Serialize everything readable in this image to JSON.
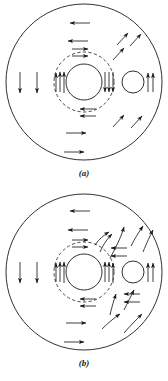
{
  "figure": {
    "type": "vector-diagram",
    "background_color": "#ffffff",
    "stroke_color": "#1a1a1a",
    "panels": [
      {
        "id": "a",
        "caption": "(a)",
        "geometry": {
          "outer_circle": {
            "cx": 84,
            "cy": 82,
            "r": 78,
            "style": "solid"
          },
          "dashed_circle": {
            "cx": 84,
            "cy": 82,
            "r": 30,
            "style": "dashed"
          },
          "inner_circle": {
            "cx": 84,
            "cy": 82,
            "r": 18,
            "style": "solid"
          },
          "small_circle": {
            "cx": 133,
            "cy": 82,
            "r": 11,
            "style": "solid"
          }
        },
        "arrow_style": "straight",
        "vector_groups": [
          {
            "name": "left-field-down",
            "direction": "down",
            "count": 2
          },
          {
            "name": "top-field-left",
            "direction": "left",
            "count": 2
          },
          {
            "name": "bottom-field-right",
            "direction": "right",
            "count": 2
          },
          {
            "name": "inner-left-up",
            "direction": "up",
            "count": 3
          },
          {
            "name": "inner-right-down",
            "direction": "down",
            "count": 3
          },
          {
            "name": "inner-top-right",
            "direction": "right",
            "count": 2
          },
          {
            "name": "inner-bottom-left",
            "direction": "left",
            "count": 2
          },
          {
            "name": "small-circle-right-up",
            "direction": "up",
            "count": 2
          },
          {
            "name": "upper-right-diagonal",
            "direction": "up-right",
            "count": 3
          },
          {
            "name": "lower-right-diagonal",
            "direction": "up-right",
            "count": 2
          }
        ]
      },
      {
        "id": "b",
        "caption": "(b)",
        "geometry": {
          "outer_circle": {
            "cx": 84,
            "cy": 82,
            "r": 78,
            "style": "solid"
          },
          "dashed_circle": {
            "cx": 84,
            "cy": 82,
            "r": 30,
            "style": "dashed"
          },
          "inner_circle": {
            "cx": 84,
            "cy": 82,
            "r": 18,
            "style": "solid"
          },
          "small_circle": {
            "cx": 133,
            "cy": 82,
            "r": 11,
            "style": "solid"
          }
        },
        "arrow_style": "curved",
        "vector_groups": [
          {
            "name": "left-field-down",
            "direction": "down",
            "count": 2
          },
          {
            "name": "top-field-left",
            "direction": "left",
            "count": 2
          },
          {
            "name": "bottom-field-right",
            "direction": "right",
            "count": 2
          },
          {
            "name": "inner-left-up",
            "direction": "up",
            "count": 3
          },
          {
            "name": "inner-right-up",
            "direction": "up",
            "count": 3
          },
          {
            "name": "inner-top-right",
            "direction": "right",
            "count": 2
          },
          {
            "name": "inner-bottom-left",
            "direction": "left",
            "count": 2
          },
          {
            "name": "small-circle-right-up",
            "direction": "up",
            "count": 2
          },
          {
            "name": "upper-right-curved",
            "direction": "curved-out",
            "count": 5
          },
          {
            "name": "right-field-left",
            "direction": "left",
            "count": 4
          },
          {
            "name": "lower-right-curved",
            "direction": "curved-in",
            "count": 4
          }
        ]
      }
    ]
  }
}
